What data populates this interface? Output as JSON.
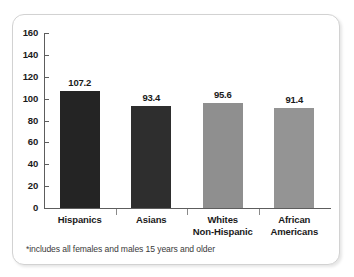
{
  "chart_data": {
    "type": "bar",
    "title": "",
    "xlabel": "",
    "ylabel": "",
    "categories": [
      "Hispanics",
      "Asians",
      "Whites Non-Hispanic",
      "African Americans"
    ],
    "category_lines": [
      [
        "Hispanics"
      ],
      [
        "Asians"
      ],
      [
        "Whites",
        "Non-Hispanic"
      ],
      [
        "African",
        "Americans"
      ]
    ],
    "values": [
      107.2,
      93.4,
      95.6,
      91.4
    ],
    "value_labels": [
      "107.2",
      "93.4",
      "95.6",
      "91.4"
    ],
    "bar_colors": [
      "#242424",
      "#2e2e2e",
      "#8f8f8f",
      "#949494"
    ],
    "ylim": [
      0,
      160
    ],
    "yticks": [
      0,
      20,
      40,
      60,
      80,
      100,
      120,
      140,
      160
    ],
    "ytick_labels": [
      "0",
      "20",
      "40",
      "60",
      "80",
      "100",
      "120",
      "140",
      "160"
    ],
    "grid": false,
    "legend": false
  },
  "footnote": "*includes all females and males 15 years and older",
  "colors": {
    "axis": "#5d5d5d",
    "text": "#1a1a1a",
    "frame": "#d2d2d2",
    "background": "#ffffff"
  }
}
